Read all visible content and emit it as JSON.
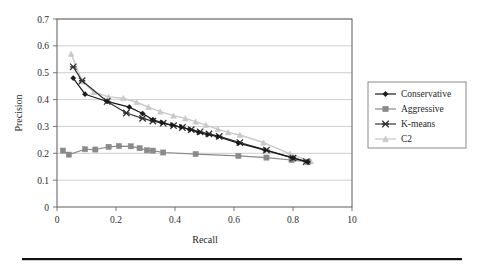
{
  "figure": {
    "caption_rule": "horizontal-rule",
    "background": "#ffffff"
  },
  "axes": {
    "x_title": "Recall",
    "y_title": "Precision",
    "x_ticks": [
      "0",
      "0.2",
      "0.4",
      "0.6",
      "0.8",
      "10"
    ],
    "y_ticks": [
      "0",
      "0.1",
      "0.2",
      "0.3",
      "0.4",
      "0.5",
      "0.6",
      "0.7"
    ]
  },
  "legend": {
    "items": [
      {
        "label": "Conservative",
        "color": "#1a1a1a",
        "marker": "diamond"
      },
      {
        "label": "Aggressive",
        "color": "#8a8a8a",
        "marker": "square"
      },
      {
        "label": "K-means",
        "color": "#333333",
        "marker": "x"
      },
      {
        "label": "C2",
        "color": "#c9c9c9",
        "marker": "triangle"
      }
    ]
  },
  "chart_data": {
    "type": "line",
    "title": "",
    "xlabel": "Recall",
    "ylabel": "Precision",
    "xlim": [
      0,
      1.0
    ],
    "ylim": [
      0,
      0.7
    ],
    "x_ticks": [
      0,
      0.2,
      0.4,
      0.6,
      0.8,
      1.0
    ],
    "x_tick_labels": [
      "0",
      "0.2",
      "0.4",
      "0.6",
      "0.8",
      "10"
    ],
    "y_ticks": [
      0,
      0.1,
      0.2,
      0.3,
      0.4,
      0.5,
      0.6,
      0.7
    ],
    "grid": "horizontal",
    "legend_position": "right-outside",
    "series": [
      {
        "name": "Conservative",
        "color": "#1a1a1a",
        "marker": "diamond",
        "points": [
          [
            0.055,
            0.48
          ],
          [
            0.095,
            0.42
          ],
          [
            0.17,
            0.393
          ],
          [
            0.245,
            0.372
          ],
          [
            0.29,
            0.348
          ],
          [
            0.325,
            0.325
          ],
          [
            0.355,
            0.314
          ],
          [
            0.39,
            0.305
          ],
          [
            0.42,
            0.298
          ],
          [
            0.45,
            0.288
          ],
          [
            0.48,
            0.278
          ],
          [
            0.51,
            0.27
          ],
          [
            0.545,
            0.262
          ],
          [
            0.615,
            0.238
          ],
          [
            0.705,
            0.212
          ],
          [
            0.8,
            0.183
          ],
          [
            0.85,
            0.168
          ]
        ]
      },
      {
        "name": "Aggressive",
        "color": "#8a8a8a",
        "marker": "square",
        "points": [
          [
            0.02,
            0.21
          ],
          [
            0.04,
            0.195
          ],
          [
            0.095,
            0.215
          ],
          [
            0.13,
            0.214
          ],
          [
            0.175,
            0.224
          ],
          [
            0.21,
            0.227
          ],
          [
            0.25,
            0.226
          ],
          [
            0.28,
            0.219
          ],
          [
            0.305,
            0.211
          ],
          [
            0.325,
            0.21
          ],
          [
            0.36,
            0.203
          ],
          [
            0.47,
            0.197
          ],
          [
            0.615,
            0.19
          ],
          [
            0.71,
            0.184
          ],
          [
            0.795,
            0.175
          ],
          [
            0.85,
            0.168
          ]
        ]
      },
      {
        "name": "K-means",
        "color": "#333333",
        "marker": "x",
        "points": [
          [
            0.055,
            0.522
          ],
          [
            0.085,
            0.47
          ],
          [
            0.17,
            0.393
          ],
          [
            0.235,
            0.35
          ],
          [
            0.29,
            0.33
          ],
          [
            0.325,
            0.32
          ],
          [
            0.36,
            0.312
          ],
          [
            0.395,
            0.303
          ],
          [
            0.425,
            0.296
          ],
          [
            0.455,
            0.288
          ],
          [
            0.485,
            0.28
          ],
          [
            0.515,
            0.272
          ],
          [
            0.55,
            0.263
          ],
          [
            0.62,
            0.24
          ],
          [
            0.71,
            0.212
          ],
          [
            0.8,
            0.182
          ],
          [
            0.845,
            0.169
          ]
        ]
      },
      {
        "name": "C2",
        "color": "#c9c9c9",
        "marker": "triangle",
        "points": [
          [
            0.048,
            0.57
          ],
          [
            0.085,
            0.468
          ],
          [
            0.125,
            0.428
          ],
          [
            0.175,
            0.41
          ],
          [
            0.225,
            0.405
          ],
          [
            0.27,
            0.39
          ],
          [
            0.31,
            0.372
          ],
          [
            0.35,
            0.355
          ],
          [
            0.395,
            0.34
          ],
          [
            0.435,
            0.33
          ],
          [
            0.47,
            0.318
          ],
          [
            0.505,
            0.305
          ],
          [
            0.545,
            0.29
          ],
          [
            0.58,
            0.278
          ],
          [
            0.62,
            0.268
          ],
          [
            0.7,
            0.24
          ],
          [
            0.79,
            0.198
          ],
          [
            0.86,
            0.17
          ]
        ]
      }
    ]
  }
}
